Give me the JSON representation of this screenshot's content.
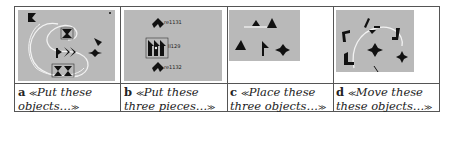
{
  "figure": {
    "panels": [
      {
        "letter": "a",
        "caption": "Put these objects…",
        "open_quote": "≪",
        "close_quote": "≫",
        "labels": []
      },
      {
        "letter": "b",
        "caption": "Put these three pieces…",
        "open_quote": "≪",
        "close_quote": "≫",
        "labels": [
          "re1131",
          "ll129",
          "re1132"
        ]
      },
      {
        "letter": "c",
        "caption": "Place these three objects…",
        "open_quote": "≪",
        "close_quote": "≫",
        "labels": []
      },
      {
        "letter": "d",
        "caption": "Move these these objects…",
        "open_quote": "≪",
        "close_quote": "≫",
        "labels": []
      }
    ],
    "colors": {
      "panel_bg": "#b9b9b9",
      "shape": "#111111",
      "trace": "#f2f2f2",
      "border": "#555555"
    }
  }
}
